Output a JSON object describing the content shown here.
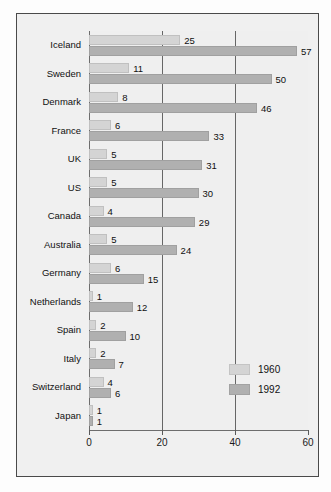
{
  "chart_data": {
    "type": "bar",
    "orientation": "horizontal",
    "title": "",
    "subtitle": "",
    "xlabel": "",
    "ylabel": "",
    "xlim": [
      0,
      60
    ],
    "xticks": [
      0,
      20,
      40,
      60
    ],
    "xtick_labels": [
      "0",
      "20",
      "40",
      "60"
    ],
    "grid": true,
    "gridlines_at": [
      20,
      40
    ],
    "legend_position": "center-right-inside",
    "categories": [
      "Iceland",
      "Sweden",
      "Denmark",
      "France",
      "UK",
      "US",
      "Canada",
      "Australia",
      "Germany",
      "Netherlands",
      "Spain",
      "Italy",
      "Switzerland",
      "Japan"
    ],
    "series": [
      {
        "name": "1960",
        "color": "#d4d4d4",
        "values": [
          25,
          11,
          8,
          6,
          5,
          5,
          4,
          5,
          6,
          1,
          2,
          2,
          4,
          1
        ]
      },
      {
        "name": "1992",
        "color": "#b0b0b0",
        "values": [
          57,
          50,
          46,
          33,
          31,
          30,
          29,
          24,
          15,
          12,
          10,
          7,
          6,
          1
        ]
      }
    ]
  },
  "legend": {
    "entries": [
      {
        "label": "1960"
      },
      {
        "label": "1992"
      }
    ]
  }
}
